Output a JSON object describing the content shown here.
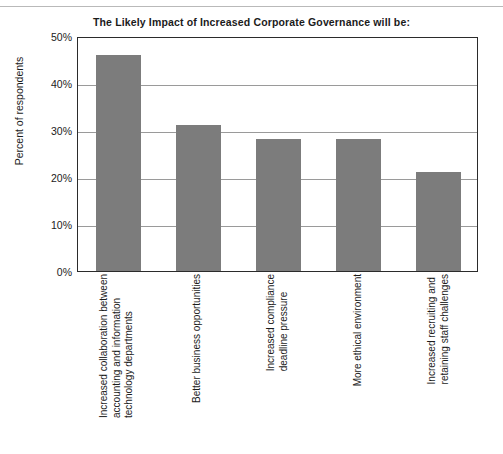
{
  "chart_data": {
    "type": "bar",
    "title": "The Likely Impact of Increased Corporate Governance will be:",
    "xlabel": "",
    "ylabel": "Percent of respondents",
    "ylim": [
      0,
      50
    ],
    "ytick_labels": [
      "50%",
      "40%",
      "30%",
      "20%",
      "10%",
      "0%"
    ],
    "ytick_values": [
      50,
      40,
      30,
      20,
      10,
      0
    ],
    "grid": "horizontal",
    "legend": "none",
    "bar_color": "#7c7c7c",
    "categories": [
      "Increased collaboration between accounting and information technology departments",
      "Better business opportunities",
      "Increased compliance deadline pressure",
      "More ethical environment",
      "Increased recruiting and retaining staff challenges"
    ],
    "category_lines": [
      [
        "Increased collaboration between",
        "accounting and information",
        "technology departments"
      ],
      [
        "Better business opportunities"
      ],
      [
        "Increased compliance",
        "deadline pressure"
      ],
      [
        "More ethical environment"
      ],
      [
        "Increased recruiting and",
        "retaining staff challenges"
      ]
    ],
    "values": [
      46,
      31,
      28,
      28,
      21
    ]
  }
}
